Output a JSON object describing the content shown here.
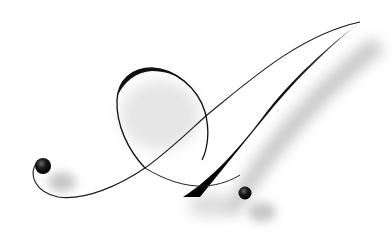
{
  "artwork": {
    "subject": "Calligraphic ornamental letter A with drop shadow",
    "letter": "A",
    "colors": {
      "background": "#ffffff",
      "ink": "#111111",
      "shadow": "#9a9a9a"
    }
  }
}
